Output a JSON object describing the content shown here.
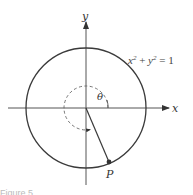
{
  "figure": {
    "equation": {
      "x": "x",
      "exp1": "2",
      "plus": " + ",
      "y": "y",
      "exp2": "2",
      "rest": " = 1"
    },
    "axis_labels": {
      "x": "x",
      "y": "y"
    },
    "angle_label": "θ",
    "point_label": "P",
    "caption": "Figure 5"
  },
  "colors": {
    "stroke": "#3a3a3a",
    "dashed": "#555555",
    "point": "#333333"
  },
  "geometry": {
    "origin": [
      86,
      108
    ],
    "unit_circle_radius": 60,
    "angle_arc_radius": 22,
    "point_P": [
      109,
      162
    ]
  }
}
